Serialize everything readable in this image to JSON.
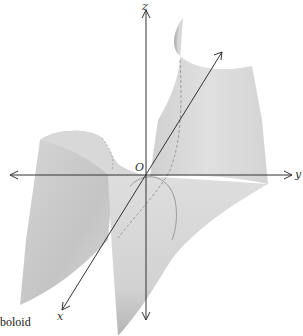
{
  "figure": {
    "caption_fragment": "boloid",
    "axes": {
      "x_label": "x",
      "y_label": "y",
      "z_label": "z",
      "origin_label": "O"
    },
    "colors": {
      "surface_light": "#e2e2e2",
      "surface_mid": "#cfcfcf",
      "surface_dark": "#b8b8b8",
      "axis": "#333333",
      "trace_curve": "#8a8a8a",
      "background": "#ffffff"
    }
  }
}
